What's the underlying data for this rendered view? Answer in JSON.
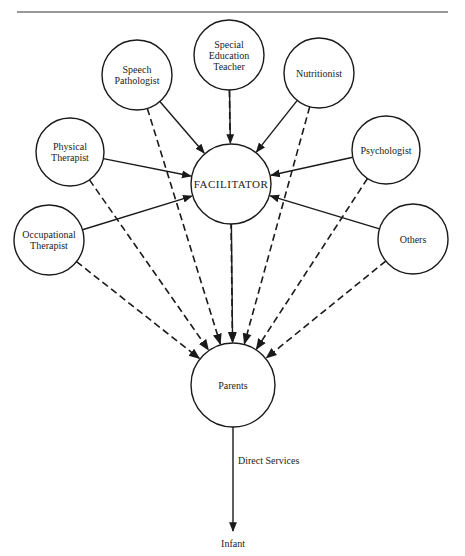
{
  "header": {
    "running_head": "",
    "rule": true
  },
  "diagram": {
    "center": {
      "id": "facilitator",
      "label": "FACILITATOR",
      "x": 231,
      "y": 184,
      "r": 40
    },
    "specialists": [
      {
        "id": "speech-pathologist",
        "lines": [
          "Speech",
          "Pathologist"
        ],
        "x": 137,
        "y": 75,
        "r": 35
      },
      {
        "id": "special-education-teacher",
        "lines": [
          "Special",
          "Education",
          "Teacher"
        ],
        "x": 229,
        "y": 55,
        "r": 35
      },
      {
        "id": "nutritionist",
        "lines": [
          "Nutritionist"
        ],
        "x": 319,
        "y": 73,
        "r": 35
      },
      {
        "id": "physical-therapist",
        "lines": [
          "Physical",
          "Therapist"
        ],
        "x": 70,
        "y": 152,
        "r": 34
      },
      {
        "id": "psychologist",
        "lines": [
          "Psychologist"
        ],
        "x": 386,
        "y": 150,
        "r": 34
      },
      {
        "id": "occupational-therapist",
        "lines": [
          "Occupational",
          "Therapist"
        ],
        "x": 49,
        "y": 240,
        "r": 35
      },
      {
        "id": "others",
        "lines": [
          "Others"
        ],
        "x": 413,
        "y": 239,
        "r": 35
      }
    ],
    "parents": {
      "id": "parents",
      "label": "Parents",
      "x": 233,
      "y": 385,
      "r": 42
    },
    "infant": {
      "label": "Infant",
      "x": 233,
      "y": 547
    },
    "direct_services": {
      "label": "Direct Services",
      "x": 238,
      "y": 464
    },
    "edges": {
      "solid_to_facilitator": "All specialists → Facilitator (solid arrows)",
      "dashed_to_parents": "All specialists → Parents (dashed arrows)",
      "solid_facilitator_to_parents": "Facilitator → Parents (solid arrow)",
      "direct_services": "Parents → Infant (solid arrow, labeled Direct Services)"
    },
    "colors": {
      "stroke": "#1a1a1a",
      "background": "#ffffff"
    }
  }
}
